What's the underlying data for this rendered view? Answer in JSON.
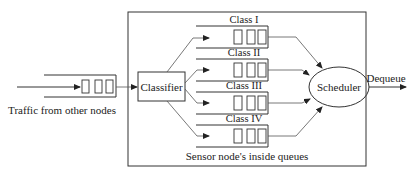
{
  "diagram": {
    "input_label": "Traffic from other nodes",
    "classifier_label": "Classifier",
    "scheduler_label": "Scheduler",
    "output_label": "Dequeue",
    "container_label": "Sensor node's inside queues",
    "queues": [
      {
        "label": "Class I"
      },
      {
        "label": "Class II"
      },
      {
        "label": "Class III"
      },
      {
        "label": "Class IV"
      }
    ],
    "colors": {
      "stroke": "#333333",
      "text": "#222222",
      "background": "#ffffff"
    }
  }
}
